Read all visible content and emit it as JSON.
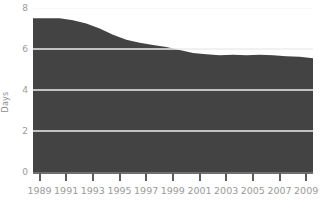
{
  "chart_data": {
    "type": "area",
    "title": "",
    "xlabel": "",
    "ylabel": "Days",
    "ylim": [
      0,
      8
    ],
    "xlim": [
      1989,
      2010
    ],
    "grid": true,
    "legend": "none",
    "series_color": "#434343",
    "gridline_color": "#f2f2f2",
    "axis_color": "#6f6f6f",
    "tick_label_color": "#9a9a9a",
    "y_ticks": [
      0,
      2,
      4,
      6,
      8
    ],
    "y_tick_labels": [
      "0",
      "2",
      "4",
      "6",
      "8"
    ],
    "x_tick_labels": [
      "1989",
      "1991",
      "1993",
      "1995",
      "1997",
      "1999",
      "2001",
      "2003",
      "2005",
      "2007",
      "2009"
    ],
    "x_tick_values": [
      1989,
      1991,
      1993,
      1995,
      1997,
      1999,
      2001,
      2003,
      2005,
      2007,
      2009
    ],
    "x": [
      1989,
      1990,
      1991,
      1992,
      1993,
      1994,
      1995,
      1996,
      1997,
      1998,
      1999,
      2000,
      2001,
      2002,
      2003,
      2004,
      2005,
      2006,
      2007,
      2008,
      2009,
      2010
    ],
    "values": [
      7.5,
      7.5,
      7.5,
      7.4,
      7.25,
      7.0,
      6.7,
      6.45,
      6.3,
      6.2,
      6.1,
      5.95,
      5.8,
      5.75,
      5.7,
      5.72,
      5.7,
      5.72,
      5.7,
      5.65,
      5.62,
      5.55
    ],
    "categories": [
      "1989",
      "1990",
      "1991",
      "1992",
      "1993",
      "1994",
      "1995",
      "1996",
      "1997",
      "1998",
      "1999",
      "2000",
      "2001",
      "2002",
      "2003",
      "2004",
      "2005",
      "2006",
      "2007",
      "2008",
      "2009",
      "2010"
    ]
  }
}
